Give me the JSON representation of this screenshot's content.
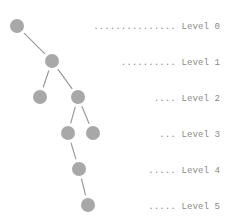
{
  "diagram": {
    "type": "tree",
    "levels": [
      {
        "leader": "...............",
        "label": "Level 0"
      },
      {
        "leader": "..........",
        "label": "Level 1"
      },
      {
        "leader": "....",
        "label": "Level 2"
      },
      {
        "leader": "...",
        "label": "Level 3"
      },
      {
        "leader": ".....",
        "label": "Level 4"
      },
      {
        "leader": ".....",
        "label": "Level 5"
      }
    ],
    "nodes": [
      {
        "id": "n0",
        "level": 0
      },
      {
        "id": "n1",
        "level": 1
      },
      {
        "id": "n2a",
        "level": 2
      },
      {
        "id": "n2b",
        "level": 2
      },
      {
        "id": "n3a",
        "level": 3
      },
      {
        "id": "n3b",
        "level": 3
      },
      {
        "id": "n4",
        "level": 4
      },
      {
        "id": "n5",
        "level": 5
      }
    ],
    "edges": [
      [
        "n0",
        "n1"
      ],
      [
        "n1",
        "n2a"
      ],
      [
        "n1",
        "n2b"
      ],
      [
        "n2b",
        "n3a"
      ],
      [
        "n2b",
        "n3b"
      ],
      [
        "n3a",
        "n4"
      ],
      [
        "n4",
        "n5"
      ]
    ]
  }
}
